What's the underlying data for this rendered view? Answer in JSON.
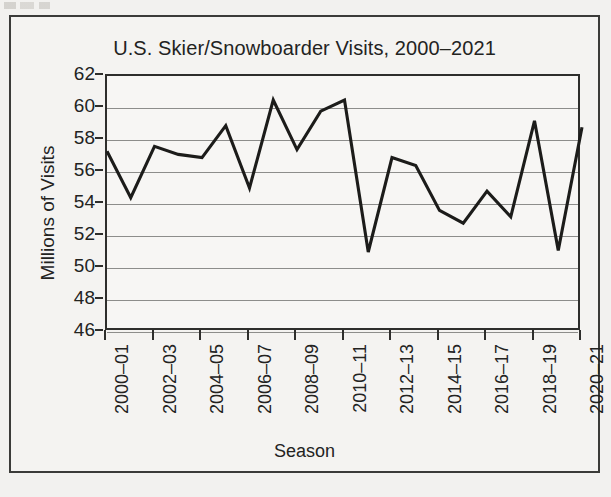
{
  "figure": {
    "background_color": "#f4f3f1",
    "border_color": "#3b3b39",
    "line_color": "#1c1c1a",
    "grid_color": "#8d8d8b"
  },
  "chart_data": {
    "type": "line",
    "title": "U.S. Skier/Snowboarder Visits, 2000–2021",
    "xlabel": "Season",
    "ylabel": "Millions of Visits",
    "ylim": [
      46,
      62
    ],
    "ytick_labels": [
      "62",
      "60",
      "58",
      "56",
      "54",
      "52",
      "50",
      "48",
      "46"
    ],
    "ytick_values": [
      62,
      60,
      58,
      56,
      54,
      52,
      50,
      48,
      46
    ],
    "grid": true,
    "grid_axis": "y",
    "legend": "none",
    "xtick_labels": [
      "2000–01",
      "2002–03",
      "2004–05",
      "2006–07",
      "2008–09",
      "2010–11",
      "2012–13",
      "2014–15",
      "2016–17",
      "2018–19",
      "2020–21"
    ],
    "categories": [
      "2000–01",
      "2001–02",
      "2002–03",
      "2003–04",
      "2004–05",
      "2005–06",
      "2006–07",
      "2007–08",
      "2008–09",
      "2009–10",
      "2010–11",
      "2011–12",
      "2012–13",
      "2013–14",
      "2014–15",
      "2015–16",
      "2016–17",
      "2017–18",
      "2018–19",
      "2019–20",
      "2020–21"
    ],
    "values": [
      57.3,
      54.4,
      57.6,
      57.1,
      56.9,
      58.9,
      55.0,
      60.5,
      57.4,
      59.8,
      60.5,
      51.0,
      56.9,
      56.4,
      53.6,
      52.8,
      54.8,
      53.2,
      59.2,
      51.1,
      58.8
    ]
  }
}
